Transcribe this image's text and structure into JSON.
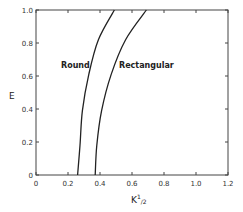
{
  "chart_data": {
    "type": "line",
    "title": "",
    "xlabel": "K½",
    "ylabel": "E",
    "xlim": [
      0,
      1.2
    ],
    "ylim": [
      0,
      1.0
    ],
    "x_ticks": [
      0,
      0.2,
      0.4,
      0.6,
      0.8,
      1.0,
      1.2
    ],
    "x_tick_labels": [
      "0",
      "0.2",
      "0.4",
      "0.6",
      "0.8",
      "1.0",
      "1.2"
    ],
    "y_ticks": [
      0,
      0.2,
      0.4,
      0.6,
      0.8,
      1.0
    ],
    "y_tick_labels": [
      "0",
      "0.2",
      "0.4",
      "0.6",
      "0.8",
      "1.0"
    ],
    "grid": false,
    "legend": "inline labels",
    "series": [
      {
        "name": "Round",
        "x": [
          0.26,
          0.275,
          0.29,
          0.33,
          0.39,
          0.49
        ],
        "y": [
          0.0,
          0.18,
          0.39,
          0.61,
          0.82,
          1.0
        ]
      },
      {
        "name": "Rectangular",
        "x": [
          0.37,
          0.38,
          0.41,
          0.47,
          0.56,
          0.69
        ],
        "y": [
          0.0,
          0.18,
          0.39,
          0.61,
          0.82,
          1.0
        ]
      }
    ],
    "annotations": [
      {
        "text": "Round",
        "x": 0.16,
        "y": 0.67
      },
      {
        "text": "Rectangular",
        "x": 0.51,
        "y": 0.67
      }
    ]
  },
  "labels": {
    "xlabel_main": "K",
    "xlabel_sup": "1",
    "xlabel_sub": "/2",
    "ylabel": "E",
    "round": "Round",
    "rectangular": "Rectangular"
  },
  "colors": {
    "line": "#222222",
    "axis": "#444444",
    "background": "#ffffff"
  }
}
